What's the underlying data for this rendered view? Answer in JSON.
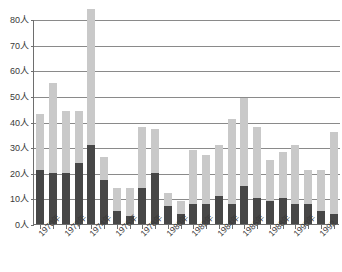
{
  "chart_data": {
    "type": "bar",
    "title": "",
    "subtitle": "",
    "xlabel": "",
    "ylabel": "",
    "stacked": true,
    "grid": true,
    "legend_position": "none",
    "ylim": [
      0,
      80
    ],
    "ytick_step": 10,
    "unit_suffix": "人",
    "ytick_labels": [
      "80人",
      "70人",
      "60人",
      "50人",
      "40人",
      "30人",
      "20人",
      "10人",
      "0人"
    ],
    "ytick_values": [
      80,
      70,
      60,
      50,
      40,
      30,
      20,
      10,
      0
    ],
    "categories": [
      "1970年",
      "1971年",
      "1972年",
      "1973年",
      "1974年",
      "1975年",
      "1976年",
      "1977年",
      "1978年",
      "1979年",
      "1980年",
      "1981年",
      "1982年",
      "1983年",
      "1984年",
      "1985年",
      "1986年",
      "1987年",
      "1988年",
      "1989年",
      "1990年",
      "1991年",
      "1992",
      "1993"
    ],
    "xtick_labels_shown": [
      "1970年",
      "1972年",
      "1974年",
      "1976年",
      "1978年",
      "1980年",
      "1982年",
      "1984年",
      "1986年",
      "1988年",
      "1990年",
      "1992"
    ],
    "series": [
      {
        "name": "lower-segment",
        "color": "#474747",
        "values": [
          21,
          20,
          20,
          24,
          31,
          17,
          5,
          3,
          14,
          20,
          7,
          4,
          8,
          8,
          11,
          8,
          15,
          10,
          9,
          10,
          8,
          8,
          5,
          4
        ]
      },
      {
        "name": "upper-segment",
        "color": "#c9c9c9",
        "values": [
          22,
          35,
          24,
          20,
          53,
          9,
          9,
          11,
          24,
          17,
          5,
          5,
          21,
          19,
          20,
          33,
          34,
          28,
          16,
          18,
          23,
          13,
          16,
          32
        ]
      }
    ],
    "totals": [
      43,
      55,
      44,
      44,
      84,
      26,
      14,
      14,
      38,
      37,
      12,
      9,
      29,
      27,
      31,
      41,
      49,
      38,
      25,
      28,
      31,
      21,
      21,
      36
    ]
  }
}
